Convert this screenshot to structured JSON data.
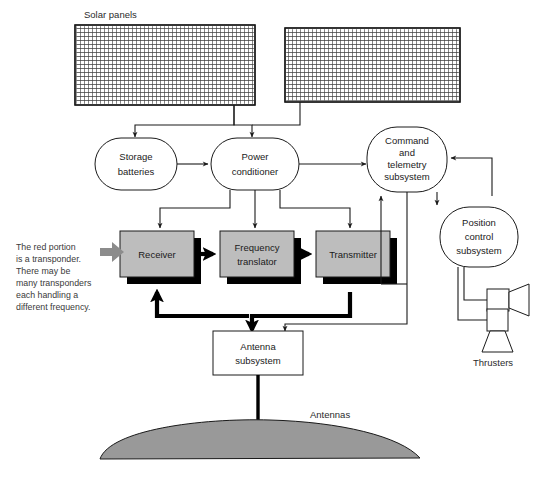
{
  "diagram": {
    "labels": {
      "solar_panels": "Solar  panels",
      "antennas": "Antennas",
      "thrusters": "Thrusters"
    },
    "nodes": {
      "storage_batteries": "Storage\nbatteries",
      "storage_batteries_l1": "Storage",
      "storage_batteries_l2": "batteries",
      "power_conditioner_l1": "Power",
      "power_conditioner_l2": "conditioner",
      "command_l1": "Command",
      "command_l2": "and",
      "command_l3": "telemetry",
      "command_l4": "subsystem",
      "position_l1": "Position",
      "position_l2": "control",
      "position_l3": "subsystem",
      "receiver": "Receiver",
      "frequency_translator_l1": "Frequency",
      "frequency_translator_l2": "translator",
      "transmitter": "Transmitter",
      "antenna_subsystem_l1": "Antenna",
      "antenna_subsystem_l2": "subsystem"
    },
    "annotation": {
      "line1": "The red portion",
      "line2": "is a transponder.",
      "line3": "There may be",
      "line4": "many transponders",
      "line5": "each handling a",
      "line6": "different frequency."
    },
    "colors": {
      "background": "#ffffff",
      "stroke": "#1a1a1a",
      "transponder_fill": "#bdbdbd",
      "shadow": "#000000",
      "dish_fill": "#999999",
      "annotation_text": "#3a3a3a",
      "callout_arrow": "#8c8c8c"
    }
  }
}
